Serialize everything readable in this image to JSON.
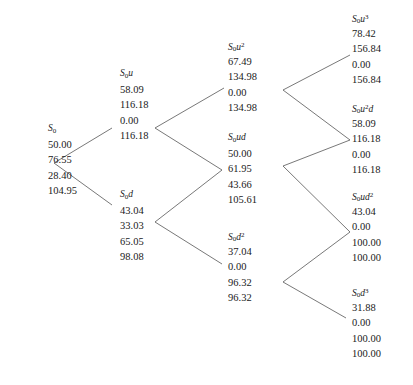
{
  "diagram": {
    "type": "binomial-lattice",
    "steps": 3,
    "value_rows": 4,
    "line_color": "#555555",
    "text_color": "#1a1a1a",
    "background": "#ffffff"
  },
  "nodes": [
    {
      "id": "s0",
      "column": 0,
      "label_base": "S",
      "label_sub": "0",
      "label_factor": "",
      "label_exp": "",
      "values": [
        "50.00",
        "76.55",
        "28.40",
        "104.95"
      ],
      "x": 48,
      "y": 121
    },
    {
      "id": "s0u",
      "column": 1,
      "label_base": "S",
      "label_sub": "0",
      "label_factor": "u",
      "label_exp": "",
      "values": [
        "58.09",
        "116.18",
        "0.00",
        "116.18"
      ],
      "x": 120,
      "y": 66
    },
    {
      "id": "s0d",
      "column": 1,
      "label_base": "S",
      "label_sub": "0",
      "label_factor": "d",
      "label_exp": "",
      "values": [
        "43.04",
        "33.03",
        "65.05",
        "98.08"
      ],
      "x": 120,
      "y": 187
    },
    {
      "id": "s0u2",
      "column": 2,
      "label_base": "S",
      "label_sub": "0",
      "label_factor": "u",
      "label_exp": "2",
      "values": [
        "67.49",
        "134.98",
        "0.00",
        "134.98"
      ],
      "x": 228,
      "y": 38
    },
    {
      "id": "s0ud",
      "column": 2,
      "label_base": "S",
      "label_sub": "0",
      "label_factor": "ud",
      "label_exp": "",
      "values": [
        "50.00",
        "61.95",
        "43.66",
        "105.61"
      ],
      "x": 228,
      "y": 130
    },
    {
      "id": "s0d2",
      "column": 2,
      "label_base": "S",
      "label_sub": "0",
      "label_factor": "d",
      "label_exp": "2",
      "values": [
        "37.04",
        "0.00",
        "96.32",
        "96.32"
      ],
      "x": 228,
      "y": 228
    },
    {
      "id": "s0u3",
      "column": 3,
      "label_base": "S",
      "label_sub": "0",
      "label_factor": "u",
      "label_exp": "3",
      "values": [
        "78.42",
        "156.84",
        "0.00",
        "156.84"
      ],
      "x": 352,
      "y": 10
    },
    {
      "id": "s0u2d",
      "column": 3,
      "label_base": "S",
      "label_sub": "0",
      "label_factor": "u",
      "label_exp": "2",
      "label_tail": "d",
      "values": [
        "58.09",
        "116.18",
        "0.00",
        "116.18"
      ],
      "x": 352,
      "y": 100
    },
    {
      "id": "s0ud2",
      "column": 3,
      "label_base": "S",
      "label_sub": "0",
      "label_factor": "ud",
      "label_exp": "2",
      "values": [
        "43.04",
        "0.00",
        "100.00",
        "100.00"
      ],
      "x": 352,
      "y": 188
    },
    {
      "id": "s0d3",
      "column": 3,
      "label_base": "S",
      "label_sub": "0",
      "label_factor": "d",
      "label_exp": "3",
      "values": [
        "31.88",
        "0.00",
        "100.00",
        "100.00"
      ],
      "x": 352,
      "y": 284
    }
  ],
  "edges": [
    {
      "from": "s0",
      "to": "s0u",
      "x1": 54,
      "y1": 163,
      "x2": 112,
      "y2": 128
    },
    {
      "from": "s0",
      "to": "s0d",
      "x1": 54,
      "y1": 163,
      "x2": 112,
      "y2": 205
    },
    {
      "from": "s0u",
      "to": "s0u2",
      "x1": 155,
      "y1": 128,
      "x2": 224,
      "y2": 88
    },
    {
      "from": "s0u",
      "to": "s0ud",
      "x1": 155,
      "y1": 128,
      "x2": 222,
      "y2": 170
    },
    {
      "from": "s0d",
      "to": "s0ud",
      "x1": 155,
      "y1": 222,
      "x2": 222,
      "y2": 170
    },
    {
      "from": "s0d",
      "to": "s0d2",
      "x1": 155,
      "y1": 222,
      "x2": 222,
      "y2": 264
    },
    {
      "from": "s0u2",
      "to": "s0u3",
      "x1": 283,
      "y1": 90,
      "x2": 350,
      "y2": 55
    },
    {
      "from": "s0u2",
      "to": "s0u2d",
      "x1": 283,
      "y1": 90,
      "x2": 350,
      "y2": 140
    },
    {
      "from": "s0ud",
      "to": "s0u2d",
      "x1": 283,
      "y1": 166,
      "x2": 350,
      "y2": 140
    },
    {
      "from": "s0ud",
      "to": "s0ud2",
      "x1": 283,
      "y1": 166,
      "x2": 350,
      "y2": 232
    },
    {
      "from": "s0d2",
      "to": "s0ud2",
      "x1": 283,
      "y1": 282,
      "x2": 350,
      "y2": 232
    },
    {
      "from": "s0d2",
      "to": "s0d3",
      "x1": 283,
      "y1": 282,
      "x2": 346,
      "y2": 318
    }
  ]
}
